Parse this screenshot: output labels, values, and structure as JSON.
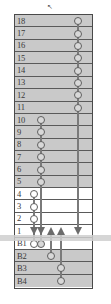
{
  "figure": {
    "colors": {
      "shaded_row": "#c9c9c9",
      "plain_row": "#ffffff",
      "frame": "#4a4a4a",
      "strand": "#7a7a7a",
      "node_fill": "#d8d8d8",
      "node_stroke": "#5f5f5f",
      "arrow": "#6b6b6b",
      "band": "#cfcfcf"
    },
    "pointer_glyph": "↖"
  },
  "grid": {
    "rows": [
      {
        "label": "18",
        "shaded": true,
        "nodes": [
          {
            "col": 4,
            "style": "filled"
          }
        ]
      },
      {
        "label": "17",
        "shaded": true,
        "nodes": [
          {
            "col": 4,
            "style": "filled"
          }
        ]
      },
      {
        "label": "16",
        "shaded": true,
        "nodes": [
          {
            "col": 4,
            "style": "filled"
          }
        ]
      },
      {
        "label": "15",
        "shaded": true,
        "nodes": [
          {
            "col": 4,
            "style": "filled"
          }
        ]
      },
      {
        "label": "14",
        "shaded": true,
        "nodes": [
          {
            "col": 4,
            "style": "filled"
          }
        ]
      },
      {
        "label": "13",
        "shaded": true,
        "nodes": [
          {
            "col": 4,
            "style": "filled"
          }
        ]
      },
      {
        "label": "12",
        "shaded": true,
        "nodes": [
          {
            "col": 4,
            "style": "filled"
          }
        ]
      },
      {
        "label": "11",
        "shaded": true,
        "nodes": [
          {
            "col": 4,
            "style": "filled"
          }
        ]
      },
      {
        "label": "10",
        "shaded": true,
        "nodes": [
          {
            "col": 1,
            "style": "filled"
          }
        ]
      },
      {
        "label": "9",
        "shaded": true,
        "nodes": [
          {
            "col": 1,
            "style": "filled"
          }
        ]
      },
      {
        "label": "8",
        "shaded": true,
        "nodes": [
          {
            "col": 1,
            "style": "filled"
          }
        ]
      },
      {
        "label": "7",
        "shaded": true,
        "nodes": [
          {
            "col": 1,
            "style": "filled"
          }
        ]
      },
      {
        "label": "6",
        "shaded": true,
        "nodes": [
          {
            "col": 1,
            "style": "filled"
          }
        ]
      },
      {
        "label": "5",
        "shaded": true,
        "nodes": [
          {
            "col": 1,
            "style": "filled"
          }
        ]
      },
      {
        "label": "4",
        "shaded": false,
        "nodes": [
          {
            "col": 0,
            "style": "open"
          }
        ]
      },
      {
        "label": "3",
        "shaded": false,
        "nodes": [
          {
            "col": 0,
            "style": "open"
          }
        ]
      },
      {
        "label": "2",
        "shaded": false,
        "nodes": [
          {
            "col": 0,
            "style": "open"
          }
        ]
      },
      {
        "label": "1",
        "shaded": false,
        "nodes": []
      },
      {
        "label": "B1",
        "shaded": false,
        "nodes": [
          {
            "col": 0,
            "style": "open"
          },
          {
            "col": 1,
            "style": "filled"
          }
        ]
      },
      {
        "label": "B2",
        "shaded": true,
        "nodes": [
          {
            "col": 2,
            "style": "filled"
          }
        ]
      },
      {
        "label": "B3",
        "shaded": true,
        "nodes": [
          {
            "col": 3,
            "style": "filled"
          }
        ]
      },
      {
        "label": "B4",
        "shaded": true,
        "nodes": [
          {
            "col": 3,
            "style": "filled"
          }
        ]
      }
    ],
    "columns_x": [
      19,
      26,
      36,
      46,
      63
    ],
    "arrows": [
      {
        "col": 0,
        "dir": "down"
      },
      {
        "col": 1,
        "dir": "down"
      },
      {
        "col": 2,
        "dir": "up"
      },
      {
        "col": 3,
        "dir": "up"
      },
      {
        "col": 4,
        "dir": "down"
      }
    ],
    "strands": [
      {
        "col": 0,
        "from_row": "4",
        "to_row": "B1"
      },
      {
        "col": 1,
        "from_row": "10",
        "to_row": "B1"
      },
      {
        "col": 2,
        "from_row": "1",
        "to_row": "B2"
      },
      {
        "col": 3,
        "from_row": "1",
        "to_row": "B4"
      },
      {
        "col": 4,
        "from_row": "18",
        "to_row": "1"
      }
    ]
  }
}
